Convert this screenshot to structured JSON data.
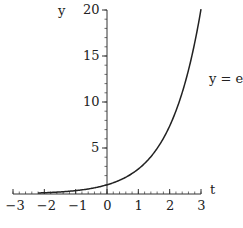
{
  "chart_data": {
    "type": "line",
    "title": "",
    "function_label": "y = e^t",
    "function_label_base": "y = e",
    "function_label_exponent": "t",
    "xlabel": "t",
    "ylabel": "y",
    "xlim": [
      -3,
      3
    ],
    "ylim": [
      0,
      20
    ],
    "x_ticks": [
      -3,
      -2,
      -1,
      0,
      1,
      2,
      3
    ],
    "x_tick_labels": [
      "−3",
      "−2",
      "−1",
      "0",
      "1",
      "2",
      "3"
    ],
    "x_minor_step": 0.2,
    "y_ticks": [
      5,
      10,
      15,
      20
    ],
    "y_tick_labels": [
      "5",
      "10",
      "15",
      "20"
    ],
    "y_minor_step": 1,
    "grid": false,
    "series": [
      {
        "name": "y = e^t",
        "t": [
          -2.2,
          -2.0,
          -1.5,
          -1.0,
          -0.5,
          0.0,
          0.5,
          1.0,
          1.5,
          2.0,
          2.5,
          3.0
        ],
        "y": [
          0.11,
          0.14,
          0.22,
          0.37,
          0.61,
          1.0,
          1.65,
          2.72,
          4.48,
          7.39,
          12.18,
          20.09
        ]
      }
    ]
  },
  "colors": {
    "axis": "#333333",
    "curve": "#222222",
    "text": "#222222",
    "background": "#ffffff"
  },
  "layout": {
    "x_px_min": 13,
    "x_px_max": 201,
    "y_px_zero": 194,
    "y_px_max": 10
  }
}
